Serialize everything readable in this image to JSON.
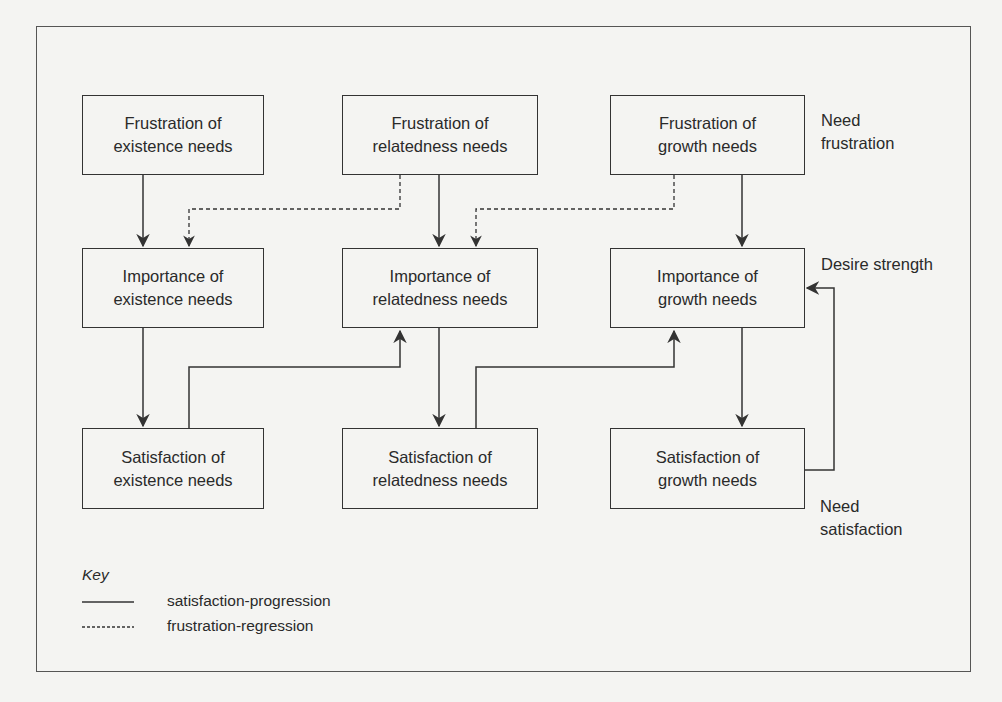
{
  "diagram": {
    "rows": {
      "frustration": [
        "Frustration of\nexistence needs",
        "Frustration of\nrelatedness needs",
        "Frustration of\ngrowth needs"
      ],
      "importance": [
        "Importance of\nexistence needs",
        "Importance of\nrelatedness needs",
        "Importance of\ngrowth needs"
      ],
      "satisfaction": [
        "Satisfaction of\nexistence needs",
        "Satisfaction of\nrelatedness needs",
        "Satisfaction of\ngrowth needs"
      ]
    },
    "side_labels": {
      "frustration": "Need\nfrustration",
      "importance": "Desire strength",
      "satisfaction": "Need\nsatisfaction"
    },
    "key": {
      "title": "Key",
      "solid": "satisfaction-progression",
      "dashed": "frustration-regression"
    },
    "colors": {
      "line": "#333333",
      "background": "#f4f4f2"
    }
  }
}
